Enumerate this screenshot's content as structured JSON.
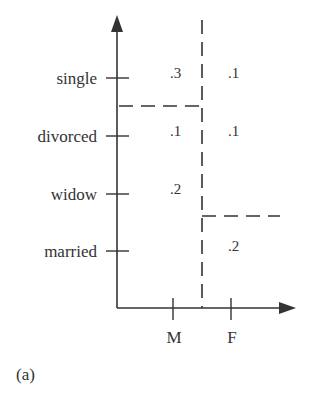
{
  "diagram": {
    "panel_label": "(a)",
    "y_axis": {
      "categories": [
        "single",
        "divorced",
        "widow",
        "married"
      ]
    },
    "x_axis": {
      "categories": [
        "M",
        "F"
      ]
    },
    "cells": {
      "single_M": ".3",
      "single_F": ".1",
      "divorced_M": ".1",
      "divorced_F": ".1",
      "widow_M": ".2",
      "married_F": ".2"
    },
    "partitions": [
      {
        "type": "vertical",
        "between": [
          "M",
          "F"
        ],
        "style": "dashed"
      },
      {
        "type": "horizontal",
        "between": [
          "single",
          "divorced"
        ],
        "side": "M",
        "style": "dashed"
      },
      {
        "type": "horizontal",
        "between": [
          "widow",
          "married"
        ],
        "side": "F",
        "style": "dashed"
      }
    ],
    "colors": {
      "ink": "#333333",
      "background": "#ffffff"
    }
  }
}
